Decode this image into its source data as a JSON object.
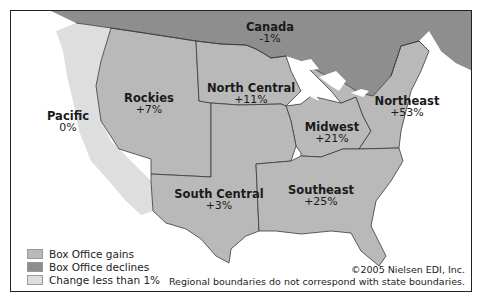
{
  "map": {
    "colors": {
      "gains": "#b9b9b9",
      "declines": "#8e8e8e",
      "change_less_1": "#dedede",
      "border": "#3a3a3a",
      "water": "#ffffff"
    },
    "regions": [
      {
        "name": "Canada",
        "value": "-1%",
        "category": "declines"
      },
      {
        "name": "Pacific",
        "value": "0%",
        "category": "change_less_1"
      },
      {
        "name": "Rockies",
        "value": "+7%",
        "category": "gains"
      },
      {
        "name": "North Central",
        "value": "+11%",
        "category": "gains"
      },
      {
        "name": "Midwest",
        "value": "+21%",
        "category": "gains"
      },
      {
        "name": "Northeast",
        "value": "+53%",
        "category": "gains"
      },
      {
        "name": "South Central",
        "value": "+3%",
        "category": "gains"
      },
      {
        "name": "Southeast",
        "value": "+25%",
        "category": "gains"
      }
    ]
  },
  "legend": {
    "items": [
      {
        "label": "Box Office gains",
        "color": "#b9b9b9"
      },
      {
        "label": "Box Office declines",
        "color": "#8e8e8e"
      },
      {
        "label": "Change less than 1%",
        "color": "#dedede"
      }
    ]
  },
  "credit": {
    "copyright": "©2005 Nielsen EDI, Inc.",
    "note": "Regional boundaries do not correspond with state boundaries."
  }
}
